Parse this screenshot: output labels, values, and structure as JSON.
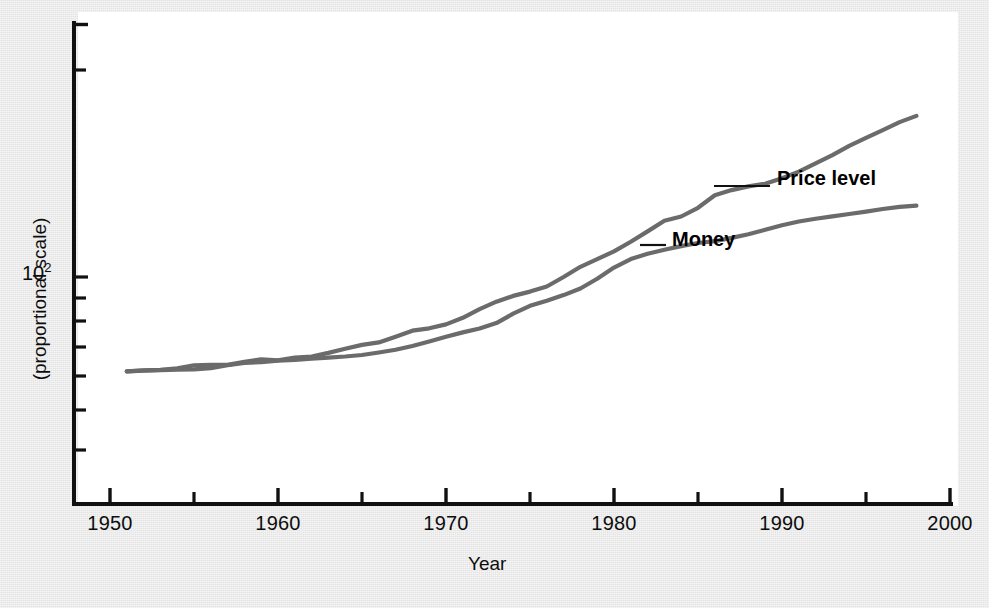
{
  "chart_data": {
    "type": "line",
    "title": "",
    "subtitle": "",
    "xlabel": "Year",
    "ylabel": "(proportional scale)",
    "y_scale": "log",
    "grid": false,
    "legend_position": "inline-annotations",
    "xlim": [
      1950,
      2000
    ],
    "ylim": [
      30,
      900
    ],
    "x_ticks_major": [
      1950,
      1960,
      1970,
      1980,
      1990,
      2000
    ],
    "x_tick_labels": [
      "1950",
      "1960",
      "1970",
      "1980",
      "1990",
      "2000"
    ],
    "x_ticks_minor": [
      1955,
      1965,
      1975,
      1985,
      1995
    ],
    "y_ticks_labeled": [
      {
        "value": 100,
        "label": "10",
        "exponent": "2"
      }
    ],
    "y_ticks_minor": [
      40,
      50,
      60,
      70,
      80,
      90,
      200,
      300,
      400,
      500,
      600,
      700,
      800
    ],
    "annotations": [
      {
        "text": "Price level",
        "series": "price_level"
      },
      {
        "text": "Money",
        "series": "money"
      }
    ],
    "series": [
      {
        "name": "Money",
        "color": "#6b6b6b",
        "x": [
          1951,
          1952,
          1953,
          1954,
          1955,
          1956,
          1957,
          1958,
          1959,
          1960,
          1961,
          1962,
          1963,
          1964,
          1965,
          1966,
          1967,
          1968,
          1969,
          1970,
          1971,
          1972,
          1973,
          1974,
          1975,
          1976,
          1977,
          1978,
          1979,
          1980,
          1981,
          1982,
          1983,
          1984,
          1985,
          1986,
          1987,
          1988,
          1989,
          1990,
          1991,
          1992,
          1993,
          1994,
          1995,
          1996,
          1997,
          1998
        ],
        "y": [
          35.0,
          35.4,
          35.6,
          36.2,
          37.4,
          37.6,
          37.6,
          38.9,
          40.0,
          39.6,
          40.8,
          41.3,
          43.0,
          45.0,
          47.0,
          48.3,
          51.5,
          55.0,
          56.5,
          59.0,
          63.5,
          70.0,
          76.0,
          81.0,
          85.0,
          90.0,
          100.0,
          112.0,
          122.0,
          133.0,
          148.0,
          166.0,
          187.0,
          196.0,
          216.0,
          248.0,
          263.0,
          274.0,
          282.0,
          300.0,
          323.0,
          354.0,
          388.0,
          430.0,
          470.0,
          512.0,
          560.0,
          600.0
        ]
      },
      {
        "name": "Price level",
        "color": "#6b6b6b",
        "x": [
          1951,
          1952,
          1953,
          1954,
          1955,
          1956,
          1957,
          1958,
          1959,
          1960,
          1961,
          1962,
          1963,
          1964,
          1965,
          1966,
          1967,
          1968,
          1969,
          1970,
          1971,
          1972,
          1973,
          1974,
          1975,
          1976,
          1977,
          1978,
          1979,
          1980,
          1981,
          1982,
          1983,
          1984,
          1985,
          1986,
          1987,
          1988,
          1989,
          1990,
          1991,
          1992,
          1993,
          1994,
          1995,
          1996,
          1997,
          1998
        ],
        "y": [
          35.0,
          35.3,
          35.5,
          35.7,
          35.8,
          36.3,
          37.5,
          38.4,
          38.8,
          39.4,
          39.8,
          40.3,
          40.8,
          41.3,
          42.0,
          43.2,
          44.5,
          46.4,
          48.8,
          51.5,
          54.0,
          56.4,
          59.9,
          66.5,
          72.6,
          76.8,
          81.8,
          88.0,
          98.0,
          111.0,
          122.0,
          129.5,
          135.5,
          141.0,
          146.0,
          149.0,
          154.5,
          161.0,
          169.0,
          178.0,
          185.5,
          191.0,
          196.5,
          201.5,
          207.0,
          213.0,
          218.0,
          221.0
        ]
      }
    ]
  },
  "axis": {
    "x_labels": [
      "1950",
      "1960",
      "1970",
      "1980",
      "1990",
      "2000"
    ],
    "x_title": "Year",
    "y_title": "(proportional scale)",
    "y_label_mantissa": "10",
    "y_label_exponent": "2"
  },
  "annotations": {
    "price_level": "Price level",
    "money": "Money"
  }
}
